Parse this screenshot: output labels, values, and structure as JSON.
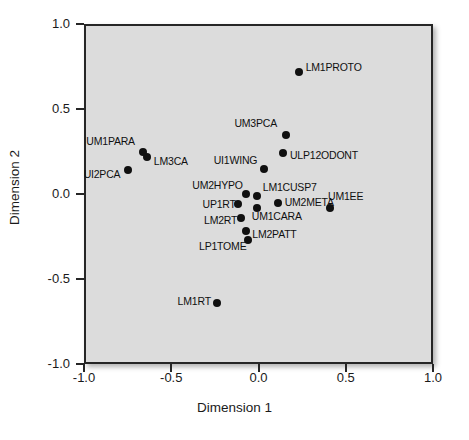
{
  "chart_data": {
    "type": "scatter",
    "title": "",
    "xlabel": "Dimension 1",
    "ylabel": "Dimension 2",
    "xlim": [
      -1.0,
      1.0
    ],
    "ylim": [
      -1.0,
      1.0
    ],
    "xticks": [
      "-1.0",
      "-0.5",
      "0.0",
      "0.5",
      "1.0"
    ],
    "xtick_values": [
      -1.0,
      -0.5,
      0.0,
      0.5,
      1.0
    ],
    "yticks": [
      "1.0",
      "0.5",
      "0.0",
      "-0.5",
      "-1.0"
    ],
    "ytick_values": [
      1.0,
      0.5,
      0.0,
      -0.5,
      -1.0
    ],
    "grid": false,
    "legend": "none",
    "panel_color": "#dcdcdc",
    "point_color": "#101010",
    "points": [
      {
        "label": "LM1PROTO",
        "x": 0.23,
        "y": 0.72,
        "lx": 7,
        "ly": -5
      },
      {
        "label": "UM3PCA",
        "x": 0.16,
        "y": 0.35,
        "lx": -52,
        "ly": -12
      },
      {
        "label": "ULP12ODONT",
        "x": 0.14,
        "y": 0.24,
        "lx": 7,
        "ly": 2
      },
      {
        "label": "UM1PARA",
        "x": -0.66,
        "y": 0.25,
        "lx": -57,
        "ly": -11
      },
      {
        "label": "LM3CA",
        "x": -0.64,
        "y": 0.22,
        "lx": 7,
        "ly": 4
      },
      {
        "label": "UI2PCA",
        "x": -0.75,
        "y": 0.14,
        "lx": -44,
        "ly": 4
      },
      {
        "label": "UI1WING",
        "x": 0.03,
        "y": 0.15,
        "lx": -50,
        "ly": -9
      },
      {
        "label": "UM2HYPO",
        "x": -0.07,
        "y": 0.0,
        "lx": -54,
        "ly": -9
      },
      {
        "label": "LM1CUSP7",
        "x": -0.01,
        "y": -0.01,
        "lx": 6,
        "ly": -9
      },
      {
        "label": "UP1RT",
        "x": -0.12,
        "y": -0.06,
        "lx": -35,
        "ly": 0
      },
      {
        "label": "UM1CARA",
        "x": -0.01,
        "y": -0.08,
        "lx": -5,
        "ly": 8
      },
      {
        "label": "UM2META",
        "x": 0.11,
        "y": -0.05,
        "lx": 7,
        "ly": -1
      },
      {
        "label": "UM1EE",
        "x": 0.41,
        "y": -0.08,
        "lx": -2,
        "ly": -12
      },
      {
        "label": "LM2RT",
        "x": -0.1,
        "y": -0.14,
        "lx": -37,
        "ly": 2
      },
      {
        "label": "LM2PATT",
        "x": -0.07,
        "y": -0.22,
        "lx": 6,
        "ly": 3
      },
      {
        "label": "LP1TOME",
        "x": -0.06,
        "y": -0.27,
        "lx": -49,
        "ly": 6
      },
      {
        "label": "LM1RT",
        "x": -0.24,
        "y": -0.64,
        "lx": -39,
        "ly": -2
      }
    ]
  }
}
